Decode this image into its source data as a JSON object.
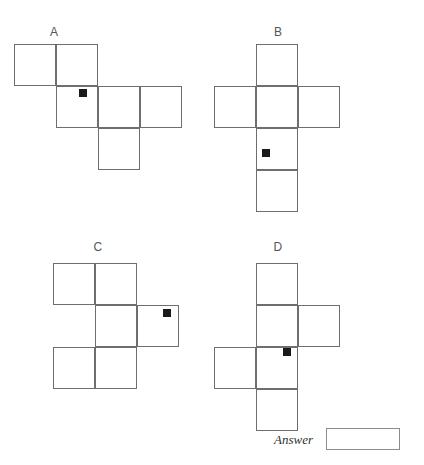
{
  "page": {
    "background_color": "#ffffff",
    "line_color": "#6e6e6e",
    "marker_color": "#1a1a1a",
    "width": 424,
    "height": 465
  },
  "options": [
    {
      "id": "A",
      "label": "A",
      "label_x": 44,
      "label_y": 26,
      "origin_x": 14,
      "origin_y": 44,
      "cell_size": 42,
      "cells": [
        {
          "col": 0,
          "row": 0
        },
        {
          "col": 1,
          "row": 0
        },
        {
          "col": 1,
          "row": 1
        },
        {
          "col": 2,
          "row": 1
        },
        {
          "col": 3,
          "row": 1
        },
        {
          "col": 2,
          "row": 2
        }
      ],
      "marker": {
        "x": 79,
        "y": 89,
        "size": 8
      }
    },
    {
      "id": "B",
      "label": "B",
      "label_x": 268,
      "label_y": 26,
      "origin_x": 214,
      "origin_y": 44,
      "cell_size": 42,
      "cells": [
        {
          "col": 1,
          "row": 0
        },
        {
          "col": 0,
          "row": 1
        },
        {
          "col": 1,
          "row": 1
        },
        {
          "col": 2,
          "row": 1
        },
        {
          "col": 1,
          "row": 2
        },
        {
          "col": 1,
          "row": 3
        }
      ],
      "marker": {
        "x": 262,
        "y": 149,
        "size": 8
      }
    },
    {
      "id": "C",
      "label": "C",
      "label_x": 88,
      "label_y": 241,
      "origin_x": 53,
      "origin_y": 263,
      "cell_size": 42,
      "cells": [
        {
          "col": 0,
          "row": 0
        },
        {
          "col": 1,
          "row": 0
        },
        {
          "col": 1,
          "row": 1
        },
        {
          "col": 2,
          "row": 1
        },
        {
          "col": 0,
          "row": 2
        },
        {
          "col": 1,
          "row": 2
        }
      ],
      "marker": {
        "x": 163,
        "y": 309,
        "size": 8
      }
    },
    {
      "id": "D",
      "label": "D",
      "label_x": 268,
      "label_y": 241,
      "origin_x": 214,
      "origin_y": 263,
      "cell_size": 42,
      "cells": [
        {
          "col": 1,
          "row": 0
        },
        {
          "col": 1,
          "row": 1
        },
        {
          "col": 2,
          "row": 1
        },
        {
          "col": 0,
          "row": 2
        },
        {
          "col": 1,
          "row": 2
        },
        {
          "col": 1,
          "row": 3
        }
      ],
      "marker": {
        "x": 283,
        "y": 348,
        "size": 8
      }
    }
  ],
  "answer": {
    "label": "Answer",
    "value": "",
    "placeholder": ""
  }
}
